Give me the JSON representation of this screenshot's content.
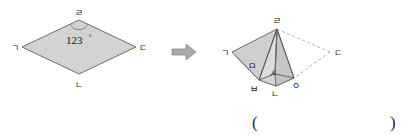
{
  "page": {
    "background_color": "#ffffff",
    "width": 401,
    "height": 135
  },
  "colors": {
    "shape_fill": "#d2d2d2",
    "shape_fill_light": "#dcdcdc",
    "shape_fill_dark": "#bdbdbd",
    "shape_stroke": "#6e6e6e",
    "dashed_stroke": "#a8a8a8",
    "arrow_fill": "#a9a9a9",
    "arrow_stroke": "#8c8c8c",
    "text_color": "#1a1a1a"
  },
  "left_figure": {
    "name": "rhombus",
    "vertices": [
      {
        "id": "g",
        "label": "ㄱ",
        "x": 22,
        "y": 47,
        "label_x": 16,
        "label_y": 50
      },
      {
        "id": "r",
        "label": "ㄹ",
        "x": 79,
        "y": 20,
        "label_x": 76,
        "label_y": 15
      },
      {
        "id": "d",
        "label": "ㄷ",
        "x": 136,
        "y": 47,
        "label_x": 138,
        "label_y": 50
      },
      {
        "id": "n",
        "label": "ㄴ",
        "x": 79,
        "y": 74,
        "label_x": 76,
        "label_y": 86
      }
    ],
    "angle": {
      "value": "123",
      "degree_symbol": "°",
      "at_vertex": "ㄹ",
      "text_x": 66,
      "text_y": 44
    }
  },
  "arrow": {
    "name": "transform-arrow",
    "x": 172,
    "y": 44,
    "width": 24,
    "height": 16
  },
  "right_figure": {
    "name": "folded-solid",
    "vertices": [
      {
        "id": "g",
        "label": "ㄱ",
        "x": 232,
        "y": 52,
        "label_x": 224,
        "label_y": 55
      },
      {
        "id": "r",
        "label": "ㄹ",
        "x": 277,
        "y": 29,
        "label_x": 274,
        "label_y": 23
      },
      {
        "id": "d",
        "label": "ㄷ",
        "x": 330,
        "y": 52,
        "label_x": 333,
        "label_y": 55
      },
      {
        "id": "m",
        "label": "ㅁ",
        "x": 255,
        "y": 66,
        "label_x": 250,
        "label_y": 66
      },
      {
        "id": "s",
        "label": "ㅅ",
        "x": 275,
        "y": 74,
        "label_x": 271,
        "label_y": 73
      },
      {
        "id": "b",
        "label": "ㅂ",
        "x": 259,
        "y": 80,
        "label_x": 253,
        "label_y": 89
      },
      {
        "id": "n",
        "label": "ㄴ",
        "x": 276,
        "y": 86,
        "label_x": 272,
        "label_y": 94
      },
      {
        "id": "o",
        "label": "ㅇ",
        "x": 294,
        "y": 78,
        "label_x": 294,
        "label_y": 86
      }
    ],
    "solid_edges": [
      "ㄱ-ㄹ",
      "ㄹ-ㅇ",
      "ㅇ-ㅂ",
      "ㅂ-ㄱ",
      "ㄹ-ㅂ",
      "ㄹ-ㅅ",
      "ㅅ-ㅂ",
      "ㅅ-ㅇ",
      "ㅅ-ㄴ",
      "ㄴ-ㅂ",
      "ㄴ-ㅇ"
    ],
    "dashed_edges": [
      "ㄹ-ㄷ",
      "ㄷ-ㅇ"
    ]
  },
  "answer_field": {
    "name": "answer-parentheses",
    "open": "(",
    "close": ")",
    "value": "",
    "open_x": 252,
    "close_x": 392,
    "y": 124
  }
}
